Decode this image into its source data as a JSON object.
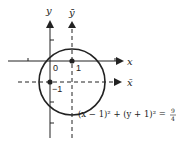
{
  "diagram": {
    "axes": {
      "x_label": "x",
      "y_label": "y",
      "xbar_label": "x̄",
      "ybar_label": "ȳ"
    },
    "tick_labels": {
      "origin": "0",
      "one": "1",
      "minus_one": "−1"
    },
    "equation": {
      "left": "(x − 1)² + (y + 1)² = ",
      "frac_num": "9",
      "frac_den": "4"
    },
    "circle": {
      "center": [
        1,
        -1
      ],
      "radius": 1.5
    },
    "colors": {
      "stroke": "#222222",
      "background": "#ffffff"
    }
  }
}
